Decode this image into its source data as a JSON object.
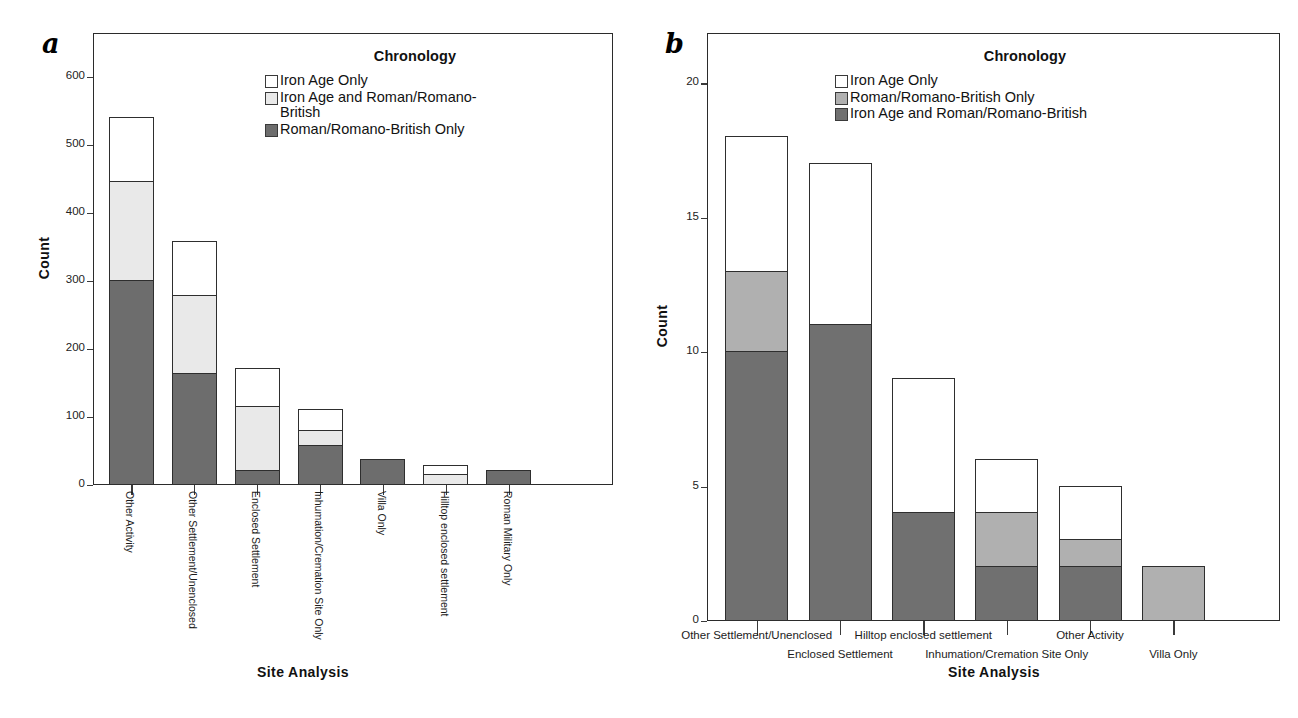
{
  "figure": {
    "panel_a_letter": "a",
    "panel_b_letter": "b"
  },
  "panel_a": {
    "legend_title": "Chronology",
    "legend": [
      {
        "label": "Iron Age Only",
        "color": "#ffffff"
      },
      {
        "label": "Iron Age and Roman/Romano-\nBritish",
        "color": "#e9e9e9"
      },
      {
        "label": "Roman/Romano-British Only",
        "color": "#6d6d6d"
      }
    ],
    "axis": {
      "ylabel": "Count",
      "xlabel": "Site Analysis",
      "yticks": [
        "0",
        "100",
        "200",
        "300",
        "400",
        "500",
        "600"
      ]
    }
  },
  "panel_b": {
    "legend_title": "Chronology",
    "legend": [
      {
        "label": "Iron Age Only",
        "color": "#ffffff"
      },
      {
        "label": "Roman/Romano-British Only",
        "color": "#b0b0b0"
      },
      {
        "label": "Iron Age and Roman/Romano-British",
        "color": "#707070"
      }
    ],
    "axis": {
      "ylabel": "Count",
      "xlabel": "Site Analysis",
      "yticks": [
        "0",
        "5",
        "10",
        "15",
        "20"
      ]
    }
  },
  "chart_data": [
    {
      "type": "bar",
      "id": "panel-a",
      "title": "",
      "stacked": true,
      "xlabel": "Site Analysis",
      "ylabel": "Count",
      "ylim": [
        0,
        650
      ],
      "yticks": [
        0,
        100,
        200,
        300,
        400,
        500,
        600
      ],
      "grid": false,
      "legend_title": "Chronology",
      "legend_position": "top-right-inside",
      "categories": [
        "Other Activity",
        "Other Settlement/Unenclosed",
        "Enclosed Settlement",
        "Inhumation/Cremation Site Only",
        "Villa Only",
        "Hilltop enclosed settlement",
        "Roman Military Only"
      ],
      "series": [
        {
          "name": "Roman/Romano-British Only",
          "color": "#6d6d6d",
          "values": [
            300,
            163,
            21,
            58,
            37,
            0,
            21
          ]
        },
        {
          "name": "Iron Age and Roman/Romano-British",
          "color": "#e9e9e9",
          "values": [
            145,
            115,
            94,
            21,
            0,
            14,
            0
          ]
        },
        {
          "name": "Iron Age Only",
          "color": "#ffffff",
          "values": [
            95,
            80,
            55,
            31,
            0,
            14,
            0
          ]
        }
      ],
      "totals": [
        540,
        358,
        170,
        110,
        37,
        28,
        21
      ]
    },
    {
      "type": "bar",
      "id": "panel-b",
      "title": "",
      "stacked": true,
      "xlabel": "Site Analysis",
      "ylabel": "Count",
      "ylim": [
        0,
        21.5
      ],
      "yticks": [
        0,
        5,
        10,
        15,
        20
      ],
      "grid": false,
      "legend_title": "Chronology",
      "legend_position": "top-right-inside",
      "categories": [
        "Other Settlement/Unenclosed",
        "Enclosed Settlement",
        "Hilltop enclosed settlement",
        "Inhumation/Cremation Site Only",
        "Other Activity",
        "Villa Only"
      ],
      "series": [
        {
          "name": "Iron Age and Roman/Romano-British",
          "color": "#707070",
          "values": [
            10,
            11,
            4,
            2,
            2,
            0
          ]
        },
        {
          "name": "Roman/Romano-British Only",
          "color": "#b0b0b0",
          "values": [
            3,
            0,
            0,
            2,
            1,
            2
          ]
        },
        {
          "name": "Iron Age Only",
          "color": "#ffffff",
          "values": [
            5,
            6,
            5,
            2,
            2,
            0
          ]
        }
      ],
      "totals": [
        18,
        17,
        9,
        6,
        5,
        2
      ]
    }
  ]
}
